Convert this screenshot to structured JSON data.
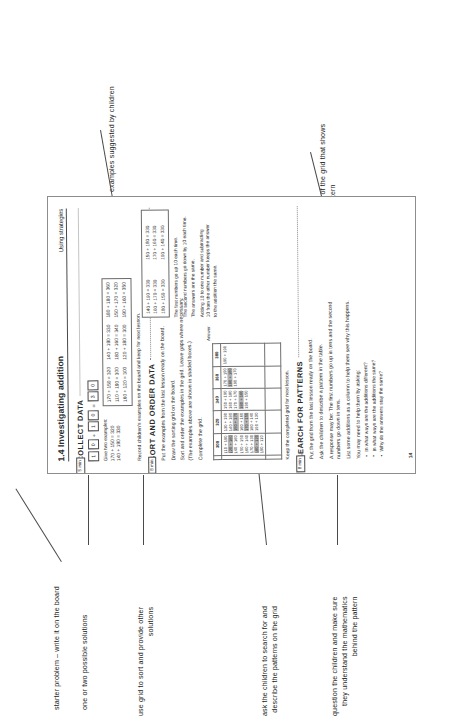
{
  "annotations": [
    {
      "id": "examples-suggested",
      "text": "examples suggested by children"
    },
    {
      "id": "grid-part-pattern",
      "text": "the part of the grid that shows\nthat pattern"
    },
    {
      "id": "starter-problem",
      "text": "starter problem – write it on the board"
    },
    {
      "id": "possible-solutions",
      "text": "one or two possible solutions"
    },
    {
      "id": "use-grid-sort",
      "text": "use grid to sort and provide other\nsolutions"
    },
    {
      "id": "search-describe-patterns",
      "text": "ask the children to search for and\ndescribe the patterns on the grid"
    },
    {
      "id": "question-children",
      "text": "question the children and make sure\nthey understand the mathematics\nbehind the pattern"
    }
  ],
  "page": {
    "header": {
      "title": "1.4 Investigating addition",
      "strand": "Using strategies"
    },
    "page_number": "14",
    "sections": [
      {
        "id": "collect-data",
        "heading": "COLLECT DATA",
        "minutes": "5 min",
        "sentence": [
          "1",
          "0",
          "+",
          "1",
          "0",
          "=",
          "3",
          "0"
        ],
        "examples_label": "Give two examples:",
        "examples_label_lines": [
          "170 + 150 = 320",
          "140 + 190 = 330"
        ],
        "note": "Record children's examples on the board and keep for next lesson.",
        "example_box": [
          "170 + 150 = 320",
          "140 + 190 = 330",
          "180 + 180 = 360",
          "110 + 190 = 300",
          "180 + 160 = 340",
          "150 + 170 = 320",
          "160 + 120 = 300",
          "120 + 180 = 300",
          "190 + 160 = 350"
        ]
      },
      {
        "id": "sort-and-order-data",
        "heading": "SORT AND ORDER DATA",
        "minutes": "8 min",
        "lines": [
          "Put the examples from the last lesson ready on the board.",
          "Draw the sorting grid on the board.",
          "Sort and order the examples in the grid. Leave gaps where necessary.",
          "(The examples above are shown in shaded boxes.)",
          "Complete the grid."
        ],
        "grid_caption": "Answer",
        "grid_col_headers": [
          "",
          "300",
          "320",
          "340",
          "360",
          "380"
        ],
        "grid_row_headers": [
          "110",
          "120",
          "140",
          "150",
          "160",
          "170",
          "180",
          "190"
        ],
        "grid_cells": [
          {
            "col": "300",
            "items": [
              {
                "t": "110 + 190",
                "hl": false
              },
              {
                "t": "120 + 180",
                "hl": true
              },
              {
                "t": "140 + 160",
                "hl": false
              },
              {
                "t": "150 + 150",
                "hl": false
              },
              {
                "t": "160 + 140",
                "hl": false
              },
              {
                "t": "170 + 130",
                "hl": false
              },
              {
                "t": "180 + 120",
                "hl": true
              },
              {
                "t": "190 + 110",
                "hl": false
              }
            ]
          },
          {
            "col": "320",
            "items": [
              {
                "t": "130 + 190",
                "hl": false
              },
              {
                "t": "140 + 180",
                "hl": false
              },
              {
                "t": "150 + 170",
                "hl": true
              },
              {
                "t": "160 + 160",
                "hl": false
              },
              {
                "t": "170 + 150",
                "hl": true
              },
              {
                "t": "180 + 140",
                "hl": false
              },
              {
                "t": "190 + 130",
                "hl": false
              }
            ]
          },
          {
            "col": "340",
            "items": [
              {
                "t": "150 + 190",
                "hl": false
              },
              {
                "t": "160 + 180",
                "hl": false
              },
              {
                "t": "170 + 170",
                "hl": false
              },
              {
                "t": "180 + 160",
                "hl": true
              },
              {
                "t": "190 + 150",
                "hl": false
              }
            ]
          },
          {
            "col": "360",
            "items": [
              {
                "t": "170 + 190",
                "hl": false
              },
              {
                "t": "180 + 180",
                "hl": true
              },
              {
                "t": "190 + 170",
                "hl": false
              }
            ]
          },
          {
            "col": "380",
            "items": [
              {
                "t": "190 + 190",
                "hl": false
              }
            ]
          }
        ],
        "closing": "Keep the completed grid for next lesson."
      },
      {
        "id": "search-for-patterns",
        "heading": "SEARCH FOR PATTERNS",
        "minutes": "8 min",
        "lines": [
          "Put the grid from the last lesson ready on the board.",
          "Ask the children to describe a pattern in the table.",
          "A response may be:  The first numbers go up in tens and the second",
          "numbers go down in tens.",
          "List some additions as a column to help them see why this happens."
        ],
        "bullets_intro": "You may need to help them by asking:",
        "bullets": [
          "In what ways are the additions different?",
          "In what ways are the additions the same?",
          "Why do the answers stay the same?"
        ]
      }
    ],
    "pattern_panel": {
      "column": [
        "140 + 190 = 330",
        "150 + 180 = 330",
        "160 + 170 = 330",
        "170 + 160 = 330",
        "180 + 150 = 330",
        "190 + 140 = 330"
      ],
      "text": [
        "The first numbers go up 10 each time.",
        "The second numbers go down by 10 each time.",
        "The answers are the same.",
        "Adding 10 to one number and subtracting",
        "10 from the other number keeps the answer",
        "to the addition the same."
      ]
    }
  }
}
